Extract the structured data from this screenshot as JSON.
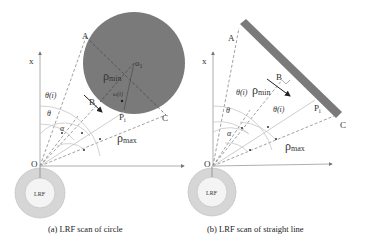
{
  "figure": {
    "panels": [
      {
        "id": "a",
        "caption": "(a) LRF scan of circle",
        "object": "circle",
        "labels": {
          "axis_x": "x",
          "origin": "O",
          "sensor": "LRF",
          "point_a": "A",
          "point_b": "B",
          "point_c": "C",
          "point_pi": "P",
          "point_pi_sub": "i",
          "center": "o",
          "center_sub": "1",
          "rho_min": "ρ",
          "rho_min_sub": "min",
          "rho_max": "ρ",
          "rho_max_sub": "max",
          "theta_i": "θ(i)",
          "theta": "θ",
          "alpha": "α",
          "angle_inner": "ω(i)"
        }
      },
      {
        "id": "b",
        "caption": "(b) LRF scan of straight line",
        "object": "straight line",
        "labels": {
          "axis_x": "x",
          "origin": "O",
          "sensor": "LRF",
          "point_a": "A",
          "point_b": "B",
          "point_c": "C",
          "point_pi": "P",
          "point_pi_sub": "i",
          "rho_min": "ρ",
          "rho_min_sub": "min",
          "rho_max": "ρ",
          "rho_max_sub": "max",
          "theta_i": "θ(i)",
          "theta": "θ",
          "alpha": "α",
          "theta_i_prime": "θ(i)"
        }
      }
    ],
    "colors": {
      "object_fill": "#7a7a7a",
      "sensor_outer": "#d6d6d6",
      "sensor_inner": "#f4f4f4",
      "text": "#333333"
    }
  }
}
